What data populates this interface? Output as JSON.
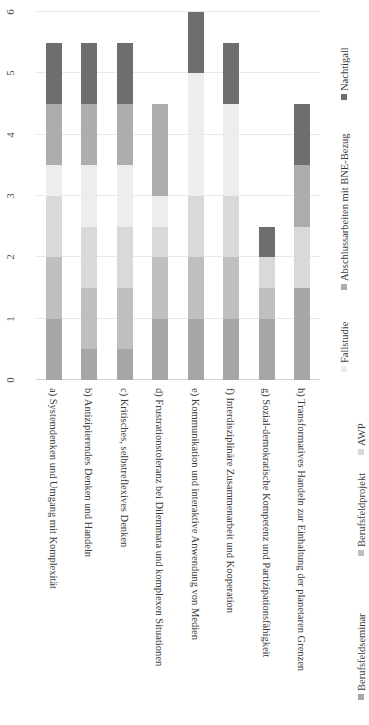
{
  "chart_data": {
    "type": "bar",
    "subtype": "stacked-bar-horizontal-rotated",
    "title": "",
    "xlabel": "",
    "ylabel": "",
    "ylim": [
      0,
      6
    ],
    "yticks": [
      0,
      1,
      2,
      3,
      4,
      5,
      6
    ],
    "ytick_labels": [
      "0",
      "1",
      "2",
      "3",
      "4",
      "5",
      "6"
    ],
    "grid": true,
    "legend_position": "right-and-bottom",
    "orientation": "rotated-90",
    "categories": [
      "a) Systemdenken und Umgang mit Komplexität",
      "b) Antizipierendes Denken und Handeln",
      "c) Kritisches, selbstreflexives Denken",
      "d) Frustrationstoleranz bei Dilemmata und komplexen Situationen",
      "e) Kommunikation und interaktive Anwendung von Medien",
      "f) Interdisziplinäre Zusammenarbeit und Kooperation",
      "g) Sozial-demokratische Kompetenz und Partizipationsfähigkeit",
      "h) Transformatives Handeln zur Einhaltung der planetaren Grenzen"
    ],
    "series": [
      {
        "name": "Berufsfeldseminar",
        "color": "#a6a6a6",
        "values": [
          1.0,
          0.5,
          0.5,
          1.0,
          1.0,
          1.0,
          1.0,
          1.5
        ]
      },
      {
        "name": "Berufsfeldprojekt",
        "color": "#bfbfbf",
        "values": [
          1.0,
          1.0,
          1.0,
          1.0,
          1.0,
          1.0,
          0.5,
          0.0
        ]
      },
      {
        "name": "AWP",
        "color": "#d9d9d9",
        "values": [
          1.0,
          1.0,
          1.0,
          0.5,
          1.0,
          1.0,
          0.5,
          1.0
        ]
      },
      {
        "name": "Fallstudie",
        "color": "#ededed",
        "values": [
          0.5,
          1.0,
          1.0,
          0.5,
          2.0,
          1.5,
          0.0,
          0.0
        ]
      },
      {
        "name": "Abschlussarbeiten mit BNE-Bezug",
        "color": "#adadad",
        "values": [
          1.0,
          1.0,
          1.0,
          1.5,
          0.0,
          0.0,
          0.0,
          1.0
        ]
      },
      {
        "name": "Nachtigall",
        "color": "#6e6e6e",
        "values": [
          1.0,
          1.0,
          1.0,
          0.0,
          1.0,
          1.0,
          0.5,
          1.0
        ]
      }
    ],
    "totals": [
      5.5,
      4.5,
      4.5,
      4.5,
      6.0,
      5.5,
      2.5,
      4.5
    ]
  },
  "legend": {
    "entries": [
      {
        "label": "Berufsfeldseminar",
        "color": "#a6a6a6"
      },
      {
        "label": "Berufsfeldprojekt",
        "color": "#bfbfbf"
      },
      {
        "label": "AWP",
        "color": "#d9d9d9"
      },
      {
        "label": "Fallstudie",
        "color": "#ededed"
      },
      {
        "label": "Abschlussarbeiten mit BNE-Bezug",
        "color": "#adadad"
      },
      {
        "label": "Nachtigall",
        "color": "#6e6e6e"
      }
    ]
  },
  "colors": {
    "background": "#ffffff",
    "gridline": "#e9e9e9",
    "axis": "#d4d4d4",
    "text": "#3a3a3a"
  }
}
